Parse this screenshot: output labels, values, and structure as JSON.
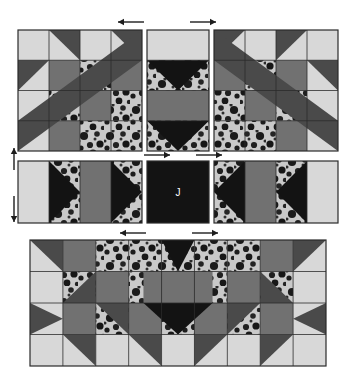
{
  "diagram": {
    "center_label": "J",
    "background_color": "#ffffff",
    "palette": {
      "light": "#d8d8d8",
      "medium": "#717171",
      "medium_dark": "#4a4a4a",
      "dark": "#131313",
      "print_base": "#c9c9c9",
      "print_blob": "#1a1a1a",
      "outline": "#2b2b2b",
      "arrow": "#1d1d1d"
    },
    "fabrics": [
      {
        "key": "light",
        "name": "light solid",
        "color": "#d8d8d8"
      },
      {
        "key": "medium",
        "name": "medium gray solid",
        "color": "#717171"
      },
      {
        "key": "medium_dark",
        "name": "dark gray solid",
        "color": "#4a4a4a"
      },
      {
        "key": "dark",
        "name": "dark solid",
        "color": "#131313"
      },
      {
        "key": "print",
        "name": "floral print",
        "color": "#c9c9c9"
      }
    ],
    "rows": [
      {
        "name": "top-row",
        "blocks": [
          {
            "name": "top-left-star-block",
            "kind": "star",
            "orientation": "normal",
            "x": 18,
            "y": 30,
            "w": 124,
            "h": 121,
            "cols": 4,
            "rows": 4
          },
          {
            "name": "top-center-sashing-block",
            "kind": "sashing-vertical",
            "x": 147,
            "y": 30,
            "w": 62,
            "h": 121,
            "cols": 1,
            "rows": 4
          },
          {
            "name": "top-right-star-block",
            "kind": "star",
            "orientation": "mirrored",
            "x": 214,
            "y": 30,
            "w": 124,
            "h": 121,
            "cols": 4,
            "rows": 4
          }
        ]
      },
      {
        "name": "middle-row",
        "blocks": [
          {
            "name": "middle-left-sashing-block",
            "kind": "sashing-horizontal",
            "x": 18,
            "y": 161,
            "w": 124,
            "h": 62,
            "cols": 4,
            "rows": 1
          },
          {
            "name": "center-square-block",
            "kind": "center-square",
            "x": 147,
            "y": 161,
            "w": 62,
            "h": 62,
            "cols": 1,
            "rows": 1
          },
          {
            "name": "middle-right-sashing-block",
            "kind": "sashing-horizontal",
            "orientation": "mirrored",
            "x": 214,
            "y": 161,
            "w": 124,
            "h": 62,
            "cols": 4,
            "rows": 1
          }
        ]
      },
      {
        "name": "bottom-row",
        "blocks": [
          {
            "name": "bottom-wide-block",
            "kind": "wide-star",
            "x": 30,
            "y": 240,
            "w": 296,
            "h": 126,
            "cols": 9,
            "rows": 4
          }
        ]
      }
    ],
    "seam_arrows": [
      {
        "name": "seam-arrow-top-left",
        "direction": "left",
        "x": 118,
        "y": 22,
        "len": 26
      },
      {
        "name": "seam-arrow-top-right",
        "direction": "right",
        "x": 190,
        "y": 22,
        "len": 26
      },
      {
        "name": "seam-arrow-mid-left",
        "direction": "right",
        "x": 144,
        "y": 155,
        "len": 26
      },
      {
        "name": "seam-arrow-mid-right",
        "direction": "right",
        "x": 196,
        "y": 155,
        "len": 26
      },
      {
        "name": "seam-arrow-bottom-left",
        "direction": "left",
        "x": 120,
        "y": 233,
        "len": 26
      },
      {
        "name": "seam-arrow-bottom-right",
        "direction": "right",
        "x": 192,
        "y": 233,
        "len": 26
      },
      {
        "name": "seam-arrow-side-up",
        "direction": "up",
        "x": 14,
        "y": 148,
        "len": 22
      },
      {
        "name": "seam-arrow-side-down",
        "direction": "down",
        "x": 14,
        "y": 196,
        "len": 26
      }
    ]
  }
}
